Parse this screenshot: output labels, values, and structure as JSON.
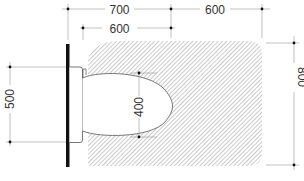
{
  "drawing": {
    "title": "WC clearance plan",
    "colors": {
      "line": "#333333",
      "dim_line": "#999999",
      "hatch": "#8a8a8a",
      "wall": "#111111",
      "background": "#ffffff"
    },
    "dimensions": {
      "top_total_left": "700",
      "top_total_right": "600",
      "top_inner": "600",
      "right_height": "800",
      "left_height": "500",
      "bowl_width": "400"
    }
  }
}
